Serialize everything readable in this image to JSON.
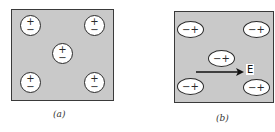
{
  "figure": {
    "panels": [
      {
        "id": "a",
        "caption": "(a)",
        "description": "Unpolarized atoms: charges centered, no field",
        "atoms": [
          {
            "shape": "circle",
            "top_sign": "+",
            "bottom_sign": "−"
          },
          {
            "shape": "circle",
            "top_sign": "+",
            "bottom_sign": "−"
          },
          {
            "shape": "circle",
            "top_sign": "+",
            "bottom_sign": "−"
          },
          {
            "shape": "circle",
            "top_sign": "+",
            "bottom_sign": "−"
          },
          {
            "shape": "circle",
            "top_sign": "+",
            "bottom_sign": "−"
          }
        ]
      },
      {
        "id": "b",
        "caption": "(b)",
        "description": "Polarized atoms in external field E",
        "field_label": "E",
        "atoms": [
          {
            "shape": "ellipse",
            "left_sign": "−",
            "right_sign": "+"
          },
          {
            "shape": "ellipse",
            "left_sign": "−",
            "right_sign": "+"
          },
          {
            "shape": "ellipse",
            "left_sign": "−",
            "right_sign": "+"
          },
          {
            "shape": "ellipse",
            "left_sign": "−",
            "right_sign": "+"
          },
          {
            "shape": "ellipse",
            "left_sign": "−",
            "right_sign": "+"
          }
        ]
      }
    ],
    "colors": {
      "panel_fill": "#c9c9c9",
      "outline": "#2a2a2a",
      "atom_fill": "#ffffff"
    }
  }
}
